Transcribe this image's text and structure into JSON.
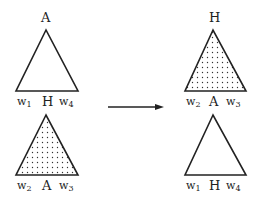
{
  "diagram": {
    "type": "tree-rotation",
    "left": {
      "top_triangle": {
        "apex_label": "A",
        "fill": "none",
        "leaves": [
          {
            "base": "w",
            "sub": "1"
          },
          {
            "text": "H"
          },
          {
            "base": "w",
            "sub": "4"
          }
        ]
      },
      "bottom_triangle": {
        "fill": "dotted",
        "leaves": [
          {
            "base": "w",
            "sub": "2"
          },
          {
            "text": "A"
          },
          {
            "base": "w",
            "sub": "3"
          }
        ]
      }
    },
    "arrow": {
      "direction": "right"
    },
    "right": {
      "top_triangle": {
        "apex_label": "H",
        "fill": "dotted",
        "leaves": [
          {
            "base": "w",
            "sub": "2"
          },
          {
            "text": "A"
          },
          {
            "base": "w",
            "sub": "3"
          }
        ]
      },
      "bottom_triangle": {
        "fill": "none",
        "leaves": [
          {
            "base": "w",
            "sub": "1"
          },
          {
            "text": "H"
          },
          {
            "base": "w",
            "sub": "4"
          }
        ]
      }
    }
  }
}
